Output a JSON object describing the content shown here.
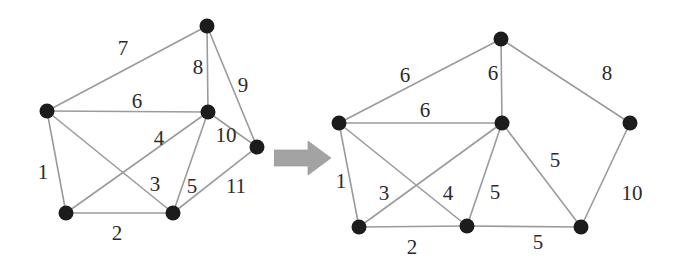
{
  "figure": {
    "background_color": "#ffffff",
    "node_color": "#1c1c1c",
    "edge_color": "#9b9b9b",
    "label_color": "#2b2b2b",
    "arrow_color": "#a0a0a0"
  },
  "arrow": {
    "name": "transformation-arrow",
    "direction": "right",
    "color": "#a0a0a0"
  },
  "chart_data": {
    "type": "diagram",
    "subtype": "weighted-undirected-graph-pair",
    "graphs": [
      {
        "id": "left-graph",
        "name": "Original weighted graph",
        "node_count": 6,
        "edge_count": 11,
        "nodes": [
          {
            "id": "L0",
            "label": "",
            "x": 47,
            "y": 111
          },
          {
            "id": "L1",
            "label": "",
            "x": 207,
            "y": 26
          },
          {
            "id": "L2",
            "label": "",
            "x": 208,
            "y": 112
          },
          {
            "id": "L3",
            "label": "",
            "x": 257,
            "y": 147
          },
          {
            "id": "L4",
            "label": "",
            "x": 66,
            "y": 213
          },
          {
            "id": "L5",
            "label": "",
            "x": 173,
            "y": 213
          }
        ],
        "edges": [
          {
            "from": "L0",
            "to": "L4",
            "weight": "1",
            "lx": 43,
            "ly": 172
          },
          {
            "from": "L4",
            "to": "L5",
            "weight": "2",
            "lx": 117,
            "ly": 233
          },
          {
            "from": "L0",
            "to": "L5",
            "weight": "3",
            "lx": 155,
            "ly": 184
          },
          {
            "from": "L4",
            "to": "L2",
            "weight": "4",
            "lx": 159,
            "ly": 138
          },
          {
            "from": "L2",
            "to": "L5",
            "weight": "5",
            "lx": 192,
            "ly": 186
          },
          {
            "from": "L0",
            "to": "L2",
            "weight": "6",
            "lx": 137,
            "ly": 101
          },
          {
            "from": "L0",
            "to": "L1",
            "weight": "7",
            "lx": 123,
            "ly": 48
          },
          {
            "from": "L1",
            "to": "L2",
            "weight": "8",
            "lx": 198,
            "ly": 67
          },
          {
            "from": "L1",
            "to": "L3",
            "weight": "9",
            "lx": 243,
            "ly": 85
          },
          {
            "from": "L2",
            "to": "L3",
            "weight": "10",
            "lx": 226,
            "ly": 135
          },
          {
            "from": "L5",
            "to": "L3",
            "weight": "11",
            "lx": 236,
            "ly": 186
          }
        ]
      },
      {
        "id": "right-graph",
        "name": "Transformed weighted graph",
        "node_count": 6,
        "edge_count": 11,
        "nodes": [
          {
            "id": "R0",
            "label": "",
            "x": 339,
            "y": 123
          },
          {
            "id": "R1",
            "label": "",
            "x": 501,
            "y": 39
          },
          {
            "id": "R2",
            "label": "",
            "x": 502,
            "y": 123
          },
          {
            "id": "R3",
            "label": "",
            "x": 630,
            "y": 123
          },
          {
            "id": "R4",
            "label": "",
            "x": 359,
            "y": 227
          },
          {
            "id": "R5",
            "label": "",
            "x": 467,
            "y": 226
          },
          {
            "id": "R6",
            "label": "",
            "x": 581,
            "y": 227
          }
        ],
        "edges": [
          {
            "from": "R0",
            "to": "R4",
            "weight": "1",
            "lx": 341,
            "ly": 181
          },
          {
            "from": "R4",
            "to": "R5",
            "weight": "2",
            "lx": 412,
            "ly": 247
          },
          {
            "from": "R0",
            "to": "R5",
            "weight": "3",
            "lx": 384,
            "ly": 193
          },
          {
            "from": "R4",
            "to": "R2",
            "weight": "4",
            "lx": 448,
            "ly": 193
          },
          {
            "from": "R2",
            "to": "R5",
            "weight": "5",
            "lx": 495,
            "ly": 192
          },
          {
            "from": "R0",
            "to": "R2",
            "weight": "6",
            "lx": 425,
            "ly": 110
          },
          {
            "from": "R0",
            "to": "R1",
            "weight": "6",
            "lx": 405,
            "ly": 75
          },
          {
            "from": "R1",
            "to": "R2",
            "weight": "6",
            "lx": 493,
            "ly": 73
          },
          {
            "from": "R1",
            "to": "R3",
            "weight": "8",
            "lx": 607,
            "ly": 73
          },
          {
            "from": "R2",
            "to": "R6",
            "weight": "5",
            "lx": 555,
            "ly": 160
          },
          {
            "from": "R5",
            "to": "R6",
            "weight": "5",
            "lx": 538,
            "ly": 242
          },
          {
            "from": "R6",
            "to": "R3",
            "weight": "10",
            "lx": 632,
            "ly": 193
          }
        ]
      }
    ]
  }
}
